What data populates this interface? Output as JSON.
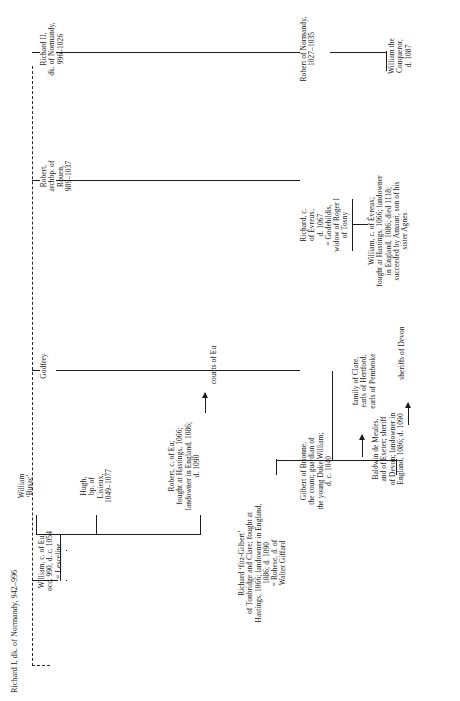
{
  "document": {
    "kind": "genealogical-table",
    "orientation": "rotated-90-ccw",
    "title": "Richard I, dk. of Normandy, 942–996"
  },
  "nodes": {
    "richard_i": "Richard I, dk. of Normandy, 942–996",
    "godfrey": "Godfrey",
    "william_eu": "William, c. of Eu,\nocc. 990, d. c. 1054\n= Lesceline",
    "gilbert_brionne": "Gilbert of Brionne,\nthe count; guardian of\nthe young Duke William;\nd. c. 1040",
    "william_busac": "William\n‘Busac’",
    "hugh_lisieux": "Hugh,\nbp. of\nLisieux,\n1049–1077",
    "robert_eu": "Robert, c. of Eu;\nfought at Hastings, 1066;\nlandowner in England, 1086;\nd. 1090",
    "counts_of_eu": "counts of Eu",
    "richard_fitzgilbert": "Richard ‘fitz-Gilbert’\nof Tonbridge and Clare; fought at\nHastings, 1066; landowner in England,\n1086; d. 1090\n= Rohese, d. of\nWalter Giffard",
    "family_of_clare": "family of Clare,\nearls of Hertford,\nearls of Pembroke",
    "baldwin_meules": "Baldwin de Meules,\nand of Exeter; sheriff\nof Devon; landowner in\nEngland, 1086; d. 1090",
    "sheriffs_of_devon": "sheriffs of Devon",
    "robert_rouen": "Robert,\narchbp. of\nRouen,\n989–1037",
    "richard_evreux": "Richard, c.\nof Évreux,\nd. 1067\n= Godehildis,\nwidow of Roger I\nof Tosny",
    "william_evreux": "William, c. of Évreux;\nfought at Hastings, 1066; landowner\nin England, 1086; died 1118;\nsucceeded by Amauri, son of his\nsister Agnes",
    "richard_ii": "Richard II,\ndk. of Normandy,\n996–1026",
    "robert_normandy": "Robert of Normandy,\n1027–1035",
    "william_conqueror": "William the\nConqueror,\nd. 1087"
  },
  "colors": {
    "ink": "#1d1d1d",
    "paper": "#ffffff"
  }
}
